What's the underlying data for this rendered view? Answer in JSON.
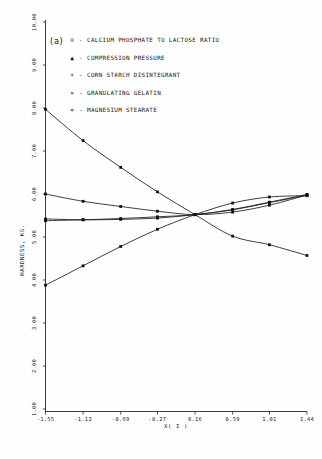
{
  "figure": {
    "panel_label": "(a)"
  },
  "legend": {
    "position": "top-left-inside",
    "entries": [
      {
        "marker": "⊙",
        "marker_name": "circle-dot-marker",
        "label": "CALCIUM PHOSPHATE TO LACTOSE RATIO"
      },
      {
        "marker": "▲",
        "marker_name": "triangle-marker",
        "label": "COMPRESSION PRESSURE"
      },
      {
        "marker": "+",
        "marker_name": "plus-marker",
        "label": "CORN STARCH DISINTEGRANT"
      },
      {
        "marker": "×",
        "marker_name": "cross-marker",
        "label": "GRANULATING GELATIN"
      },
      {
        "marker": "✡",
        "marker_name": "diamond-marker",
        "label": "MAGNESIUM STEARATE"
      }
    ]
  },
  "chart_data": {
    "type": "line",
    "title": "",
    "xlabel": "X( I )",
    "ylabel": "HARDNESS, KG.",
    "xlim": [
      -1.55,
      1.44
    ],
    "ylim": [
      1.0,
      10.0
    ],
    "grid": false,
    "xticks": [
      "-1.55",
      "-1.12",
      "-0.69",
      "-0.27",
      "0.16",
      "0.59",
      "1.01",
      "1.44"
    ],
    "xtick_values": [
      -1.55,
      -1.12,
      -0.69,
      -0.27,
      0.16,
      0.59,
      1.01,
      1.44
    ],
    "yticks": [
      "1.00",
      "2.00",
      "3.00",
      "4.00",
      "5.00",
      "6.00",
      "7.00",
      "8.00",
      "9.00",
      "10.00"
    ],
    "ytick_values": [
      1,
      2,
      3,
      4,
      5,
      6,
      7,
      8,
      9,
      10
    ],
    "x": [
      -1.55,
      -1.12,
      -0.69,
      -0.27,
      0.16,
      0.59,
      1.01,
      1.44
    ],
    "series": [
      {
        "name": "CALCIUM PHOSPHATE TO LACTOSE RATIO",
        "marker": "⊙",
        "values": [
          7.97,
          7.24,
          6.62,
          6.05,
          5.52,
          5.02,
          4.82,
          4.57
        ]
      },
      {
        "name": "COMPRESSION PRESSURE",
        "marker": "▲",
        "values": [
          5.42,
          5.4,
          5.41,
          5.44,
          5.52,
          5.63,
          5.8,
          5.97
        ]
      },
      {
        "name": "CORN STARCH DISINTEGRANT",
        "marker": "+",
        "values": [
          6.0,
          5.83,
          5.71,
          5.6,
          5.52,
          5.58,
          5.74,
          5.98
        ]
      },
      {
        "name": "GRANULATING GELATIN",
        "marker": "×",
        "values": [
          5.38,
          5.4,
          5.43,
          5.47,
          5.52,
          5.64,
          5.81,
          5.99
        ]
      },
      {
        "name": "MAGNESIUM STEARATE",
        "marker": "✡",
        "values": [
          3.88,
          4.33,
          4.78,
          5.18,
          5.52,
          5.79,
          5.93,
          5.96
        ]
      }
    ]
  }
}
